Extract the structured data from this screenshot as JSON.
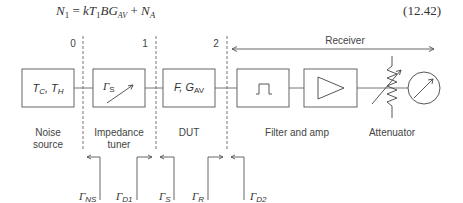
{
  "equation": {
    "lhs": "N",
    "lhs_sub": "1",
    "rhs_parts": [
      "= kT",
      "1",
      "BG",
      "AV",
      " + N",
      "A"
    ],
    "number": "(12.42)"
  },
  "reference_planes": [
    {
      "label": "0"
    },
    {
      "label": "1"
    },
    {
      "label": "2"
    }
  ],
  "receiver": {
    "label": "Receiver"
  },
  "blocks": {
    "noise_source": {
      "text_main": "T",
      "sub1": "C",
      "sep": ", T",
      "sub2": "H",
      "caption_line1": "Noise",
      "caption_line2": "source"
    },
    "impedance_tuner": {
      "text_main": "Γ",
      "sub": "S",
      "caption_line1": "Impedance",
      "caption_line2": "tuner"
    },
    "dut": {
      "text_main": "F, G",
      "sub": "AV",
      "caption": "DUT"
    },
    "filter_amp": {
      "caption": "Filter and amp"
    },
    "attenuator": {
      "caption": "Attenuator"
    }
  },
  "reflection_coefficients": [
    {
      "symbol": "Γ",
      "sub": "NS"
    },
    {
      "symbol": "Γ",
      "sub": "D1"
    },
    {
      "symbol": "Γ",
      "sub": "S"
    },
    {
      "symbol": "Γ",
      "sub": "R"
    },
    {
      "symbol": "Γ",
      "sub": "D2"
    }
  ],
  "colors": {
    "line": "#4a4a4a",
    "text": "#333333",
    "background": "#ffffff"
  }
}
